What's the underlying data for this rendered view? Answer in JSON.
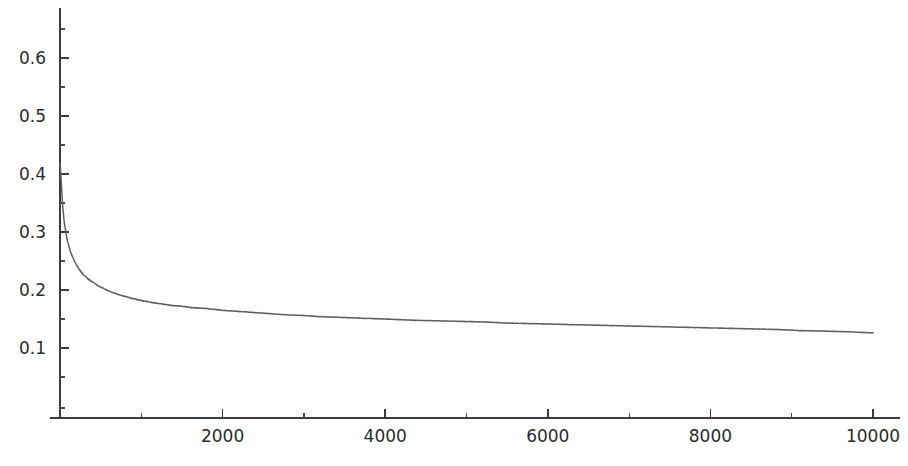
{
  "chart_data": {
    "type": "line",
    "title": "",
    "subtitle": "",
    "xlabel": "",
    "ylabel": "",
    "grid": false,
    "legend": null,
    "legend_position": "none",
    "annotations": [],
    "xlim": [
      0,
      10000
    ],
    "ylim": [
      0,
      0.68
    ],
    "x_ticks_major": [
      2000,
      4000,
      6000,
      8000,
      10000
    ],
    "x_tick_labels": [
      "2000",
      "4000",
      "6000",
      "8000",
      "10000"
    ],
    "x_ticks_minor": [
      1000,
      3000,
      5000,
      7000,
      9000
    ],
    "y_ticks_major": [
      0.1,
      0.2,
      0.3,
      0.4,
      0.5,
      0.6
    ],
    "y_tick_labels": [
      "0.1",
      "0.2",
      "0.3",
      "0.4",
      "0.5",
      "0.6"
    ],
    "y_ticks_minor": [
      0.05,
      0.15,
      0.25,
      0.35,
      0.45,
      0.55,
      0.65
    ],
    "series": [
      {
        "name": "decay",
        "color": "#5f5f5f",
        "x": [
          1,
          5,
          10,
          15,
          20,
          25,
          30,
          40,
          50,
          60,
          70,
          80,
          90,
          100,
          120,
          140,
          160,
          180,
          200,
          230,
          260,
          300,
          340,
          380,
          420,
          460,
          500,
          560,
          620,
          680,
          740,
          800,
          900,
          1000,
          1100,
          1200,
          1300,
          1400,
          1500,
          1600,
          1800,
          2000,
          2200,
          2400,
          2600,
          2800,
          3000,
          3200,
          3400,
          3600,
          3800,
          4000,
          4300,
          4600,
          4900,
          5200,
          5500,
          5800,
          6100,
          6400,
          6700,
          7000,
          7300,
          7600,
          7900,
          8200,
          8500,
          8800,
          9100,
          9400,
          9700,
          10000
        ],
        "y": [
          0.42,
          0.412,
          0.4,
          0.388,
          0.375,
          0.364,
          0.352,
          0.334,
          0.32,
          0.31,
          0.3,
          0.292,
          0.285,
          0.28,
          0.27,
          0.262,
          0.255,
          0.249,
          0.244,
          0.237,
          0.231,
          0.225,
          0.22,
          0.215,
          0.212,
          0.208,
          0.205,
          0.201,
          0.197,
          0.194,
          0.191,
          0.189,
          0.185,
          0.182,
          0.179,
          0.177,
          0.175,
          0.173,
          0.172,
          0.17,
          0.168,
          0.165,
          0.163,
          0.161,
          0.159,
          0.157,
          0.156,
          0.154,
          0.153,
          0.152,
          0.151,
          0.15,
          0.148,
          0.147,
          0.146,
          0.145,
          0.143,
          0.142,
          0.141,
          0.14,
          0.139,
          0.138,
          0.137,
          0.136,
          0.135,
          0.134,
          0.133,
          0.132,
          0.13,
          0.129,
          0.128,
          0.126
        ]
      }
    ]
  },
  "axes": {
    "y_axis_name": "y-axis",
    "x_axis_name": "x-axis"
  }
}
